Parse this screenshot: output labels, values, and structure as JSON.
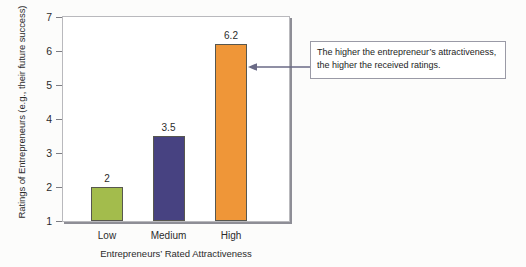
{
  "chart_data": {
    "type": "bar",
    "title": "",
    "categories": [
      "Low",
      "Medium",
      "High"
    ],
    "values": [
      2,
      3.5,
      6.2
    ],
    "value_labels": [
      "2",
      "3.5",
      "6.2"
    ],
    "bar_colors": [
      "#a3bc4c",
      "#474281",
      "#ef9638"
    ],
    "xlabel": "Entrepreneurs’ Rated Attractiveness",
    "ylabel": "Ratings of Entrepreneurs (e.g., their future success)",
    "ylim": [
      1,
      7
    ],
    "yticks": [
      1,
      2,
      3,
      4,
      5,
      6,
      7
    ],
    "ytick_labels": [
      "1",
      "2",
      "3",
      "4",
      "5",
      "6",
      "7"
    ],
    "grid": false,
    "legend": "none",
    "annotations": [
      {
        "text": "The higher the entrepreneur’s attractiveness, the higher the received ratings.",
        "line1": "The higher the entrepreneur’s attractiveness,",
        "line2": "the higher the received ratings.",
        "points_to": "High",
        "arrow_direction": "left"
      }
    ]
  },
  "colors": {
    "plot_border": "#b9b9bd",
    "axis_text": "#2b2b2b",
    "annotation_border": "#9a9aa6",
    "arrow": "#6a6a86",
    "background": "#fcfcfb"
  }
}
